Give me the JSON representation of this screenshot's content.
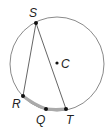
{
  "diagram": {
    "type": "circle-inscribed-angle",
    "circle": {
      "center_label": "C",
      "cx": 57,
      "cy": 64,
      "r": 47,
      "stroke": "#888888"
    },
    "points": [
      {
        "label": "S",
        "x": 36,
        "y": 23
      },
      {
        "label": "R",
        "x": 23,
        "y": 96
      },
      {
        "label": "Q",
        "x": 46,
        "y": 109
      },
      {
        "label": "T",
        "x": 66,
        "y": 109
      },
      {
        "label": "C",
        "x": 57,
        "y": 63
      }
    ],
    "segments": [
      [
        "S",
        "R"
      ],
      [
        "S",
        "T"
      ]
    ],
    "highlighted_arcs": [
      [
        "R",
        "Q"
      ],
      [
        "Q",
        "T"
      ]
    ],
    "labels": {
      "S": "S",
      "C": "C",
      "R": "R",
      "Q": "Q",
      "T": "T"
    }
  }
}
